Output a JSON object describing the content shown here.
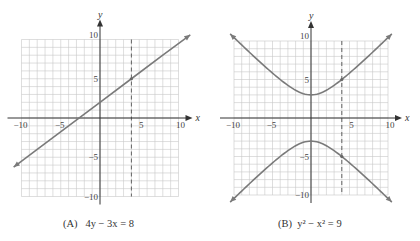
{
  "chart_data": [
    {
      "type": "line",
      "title": "(A) 4y − 3x = 8",
      "caption_label": "(A)",
      "caption_eq": "4y − 3x = 8",
      "xlabel": "x",
      "ylabel": "y",
      "xlim": [
        -10,
        10
      ],
      "ylim": [
        -10,
        10
      ],
      "xticks": [
        -10,
        -5,
        5,
        10
      ],
      "yticks": [
        10,
        5,
        -5,
        -10
      ],
      "grid": true,
      "series": [
        {
          "name": "4y - 3x = 8",
          "equation": "y = 0.75x + 2",
          "x": [
            -11,
            -8,
            -4,
            0,
            4,
            8,
            11.5
          ],
          "y": [
            -6.25,
            -4,
            -1,
            2,
            5,
            8,
            10.6
          ]
        }
      ],
      "annotations": [
        {
          "type": "vertical-dashed-line",
          "x": 4
        },
        {
          "type": "point",
          "x": 4,
          "y": 5
        }
      ]
    },
    {
      "type": "line",
      "title": "(B) y² − x² = 9",
      "caption_label": "(B)",
      "caption_eq": "y² − x² = 9",
      "xlabel": "x",
      "ylabel": "y",
      "xlim": [
        -10,
        10
      ],
      "ylim": [
        -10,
        10
      ],
      "xticks": [
        -10,
        -5,
        5,
        10
      ],
      "yticks": [
        10,
        5,
        -5,
        -10
      ],
      "grid": true,
      "series": [
        {
          "name": "upper branch",
          "equation": "y = sqrt(x^2 + 9)",
          "x": [
            -10.5,
            -8,
            -4,
            0,
            4,
            8,
            10.5
          ],
          "y": [
            10.92,
            8.54,
            5,
            3,
            5,
            8.54,
            10.92
          ]
        },
        {
          "name": "lower branch",
          "equation": "y = -sqrt(x^2 + 9)",
          "x": [
            -10.5,
            -8,
            -4,
            0,
            4,
            8,
            10.5
          ],
          "y": [
            -10.92,
            -8.54,
            -5,
            -3,
            -5,
            -8.54,
            -10.92
          ]
        }
      ],
      "annotations": [
        {
          "type": "vertical-dashed-line",
          "x": 4
        },
        {
          "type": "point",
          "x": 4,
          "y": 5
        },
        {
          "type": "point",
          "x": 4,
          "y": -5
        }
      ]
    }
  ],
  "panels": {
    "a": {
      "label": "(A)",
      "eq_html_parts": [
        "4y − 3",
        "x",
        " = 8"
      ]
    },
    "b": {
      "label": "(B)",
      "y": "y",
      "x": "x",
      "rest": " = 9"
    }
  },
  "axis_labels": {
    "x": "x",
    "y": "y"
  },
  "ticks": {
    "n10": "−10",
    "n5": "−5",
    "p5": "5",
    "p10": "10"
  }
}
